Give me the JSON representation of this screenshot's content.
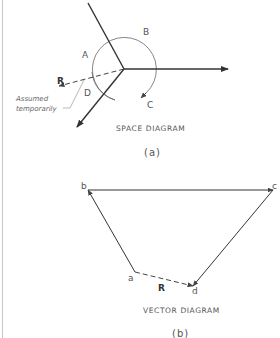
{
  "space_diagram": {
    "caption": "SPACE DIAGRAM",
    "sublabel": "(a)",
    "regions": [
      "A",
      "B",
      "C",
      "D"
    ],
    "resultant_label": "R",
    "note_line1": "Assumed",
    "note_line2": "temporarily"
  },
  "vector_diagram": {
    "caption": "VECTOR DIAGRAM",
    "sublabel": "(b)",
    "points": [
      "a",
      "b",
      "c",
      "d"
    ],
    "resultant_label": "R"
  },
  "colors": {
    "line": "#333333",
    "thin": "#555555",
    "text": "#555555"
  }
}
